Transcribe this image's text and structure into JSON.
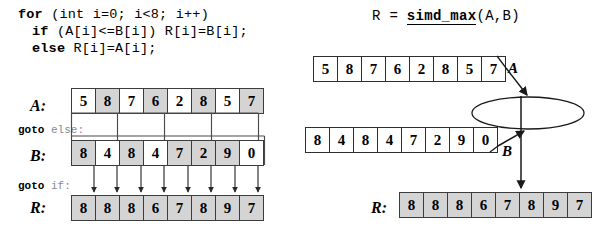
{
  "figure": {
    "left_panel": {
      "code": {
        "line1_kw": "for",
        "line1_rest": " (int i=0; i<8; i++)",
        "line2_kw": "if",
        "line2_rest": " (A[i]<=B[i]) R[i]=B[i];",
        "line3_kw": "else",
        "line3_rest": " R[i]=A[i];"
      },
      "labels": {
        "a": "A:",
        "b": "B:",
        "r": "R:",
        "goto_else_kw": "goto",
        "goto_else_target": "else:",
        "goto_if_kw": "goto",
        "goto_if_target": "if:"
      },
      "arrays": {
        "A": {
          "values": [
            "5",
            "8",
            "7",
            "6",
            "2",
            "8",
            "5",
            "7"
          ],
          "shaded": [
            false,
            true,
            false,
            true,
            false,
            true,
            false,
            true
          ]
        },
        "B": {
          "values": [
            "8",
            "4",
            "8",
            "4",
            "7",
            "2",
            "9",
            "0"
          ],
          "shaded": [
            true,
            false,
            true,
            false,
            true,
            true,
            true,
            false
          ]
        },
        "R": {
          "values": [
            "8",
            "8",
            "8",
            "6",
            "7",
            "8",
            "9",
            "7"
          ],
          "shaded": [
            true,
            true,
            true,
            true,
            true,
            true,
            true,
            true
          ]
        }
      }
    },
    "right_panel": {
      "formula_lhs": "R = ",
      "formula_fn": "simd_max",
      "formula_args": "(A,B)",
      "operator_label": "simd_max",
      "labels": {
        "a": "A",
        "b": "B",
        "r": "R:"
      },
      "arrays": {
        "A": {
          "values": [
            "5",
            "8",
            "7",
            "6",
            "2",
            "8",
            "5",
            "7"
          ],
          "shaded": [
            false,
            false,
            false,
            false,
            false,
            false,
            false,
            false
          ]
        },
        "B": {
          "values": [
            "8",
            "4",
            "8",
            "4",
            "7",
            "2",
            "9",
            "0"
          ],
          "shaded": [
            false,
            false,
            false,
            false,
            false,
            false,
            false,
            false
          ]
        },
        "R": {
          "values": [
            "8",
            "8",
            "8",
            "6",
            "7",
            "8",
            "9",
            "7"
          ],
          "shaded": [
            true,
            true,
            true,
            true,
            true,
            true,
            true,
            true
          ]
        }
      }
    }
  },
  "colors": {
    "shaded_cell": "#d4d4d4",
    "cell_border": "#3c3c3c",
    "ink": "#000000",
    "faint_ink": "#8a8a8a"
  }
}
